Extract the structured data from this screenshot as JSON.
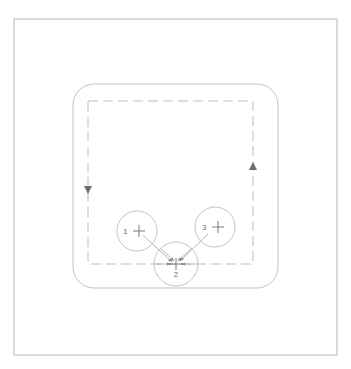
{
  "diagram": {
    "background_color": "#ffffff",
    "outer_frame": {
      "name": "outer-frame",
      "x": 14,
      "y": 19,
      "width": 323,
      "height": 336,
      "stroke_color": "#b8b8bc",
      "stroke_width": 1,
      "style": "solid"
    },
    "rounded_panel": {
      "name": "rounded-panel",
      "x": 73,
      "y": 84,
      "width": 205,
      "height": 204,
      "corner_radius": 21,
      "stroke_color": "#c2c2c6",
      "stroke_width": 1,
      "style": "solid"
    },
    "dashed_boundary": {
      "name": "dashed-boundary",
      "x": 88,
      "y": 101,
      "width": 165,
      "height": 163,
      "stroke_color": "#bdbdc1",
      "stroke_width": 1,
      "style": "dashed",
      "dash_pattern": "10 5"
    },
    "direction_arrows": [
      {
        "name": "left-edge-arrow-down",
        "x": 88,
        "y": 190,
        "direction": "down",
        "color": "#6e6e72"
      },
      {
        "name": "right-edge-arrow-up",
        "x": 253,
        "y": 166,
        "direction": "up",
        "color": "#6e6e72"
      }
    ],
    "callouts": [
      {
        "id": "callout-1",
        "label": "1",
        "cx": 137,
        "cy": 231,
        "r": 20,
        "label_x": 123,
        "label_y": 234,
        "crosshair_x": 139,
        "crosshair_y": 231,
        "crosshair_size": 6,
        "stroke_color": "#bdbdc1",
        "leader_to": "callout-2"
      },
      {
        "id": "callout-3",
        "label": "3",
        "cx": 215,
        "cy": 227,
        "r": 20,
        "label_x": 202,
        "label_y": 230,
        "crosshair_x": 218,
        "crosshair_y": 227,
        "crosshair_size": 6,
        "stroke_color": "#bdbdc1",
        "leader_to": "callout-2"
      },
      {
        "id": "callout-2",
        "label": "2",
        "cx": 176,
        "cy": 264,
        "r": 22,
        "label_x": 176,
        "label_y": 277,
        "crosshair_x": 176,
        "crosshair_y": 264,
        "crosshair_size": 6,
        "stroke_color": "#bdbdc1",
        "leader_to": null
      }
    ],
    "leader_lines": [
      {
        "name": "leader-line-1-to-2",
        "x1": 143,
        "y1": 235,
        "x2": 172,
        "y2": 262,
        "color": "#a9a9ad",
        "arrow_at": "end"
      },
      {
        "name": "leader-line-3-to-2",
        "x1": 208,
        "y1": 234,
        "x2": 180,
        "y2": 261,
        "color": "#a9a9ad",
        "arrow_at": "end"
      },
      {
        "name": "leader-line-left-to-2",
        "x1": 156,
        "y1": 264,
        "x2": 171,
        "y2": 264,
        "color": "#a9a9ad",
        "arrow_at": "end"
      },
      {
        "name": "leader-line-right-to-2",
        "x1": 196,
        "y1": 264,
        "x2": 181,
        "y2": 264,
        "color": "#a9a9ad",
        "arrow_at": "end"
      },
      {
        "name": "leader-line-upleft-to-2",
        "x1": 160,
        "y1": 248,
        "x2": 174,
        "y2": 261,
        "color": "#a9a9ad",
        "arrow_at": "end"
      },
      {
        "name": "leader-line-upright-to-2",
        "x1": 192,
        "y1": 248,
        "x2": 178,
        "y2": 261,
        "color": "#a9a9ad",
        "arrow_at": "end"
      }
    ]
  }
}
